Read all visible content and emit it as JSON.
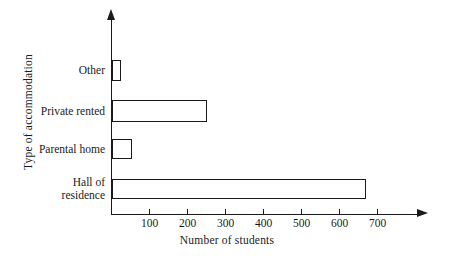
{
  "chart_data": {
    "type": "bar",
    "orientation": "horizontal",
    "title": "",
    "xlabel": "Number of students",
    "ylabel": "Type of accommodation",
    "categories": [
      "Other",
      "Private rented",
      "Parental home",
      "Hall of\nresidence"
    ],
    "values": [
      25,
      250,
      53,
      670
    ],
    "xlim": [
      0,
      800
    ],
    "xticks": [
      100,
      200,
      300,
      400,
      500,
      600,
      700
    ],
    "xtick_labels": [
      "100",
      "200",
      "300",
      "400",
      "500",
      "600",
      "700"
    ],
    "grid": false,
    "legend": null,
    "bar_fill_color": "#ffffff",
    "bar_edge_color": "#1a1a1a",
    "axis_color": "#1a1a1a",
    "background_color": "#ffffff"
  },
  "axes": {
    "x_title": "Number of students",
    "y_title": "Type of accommodation"
  }
}
